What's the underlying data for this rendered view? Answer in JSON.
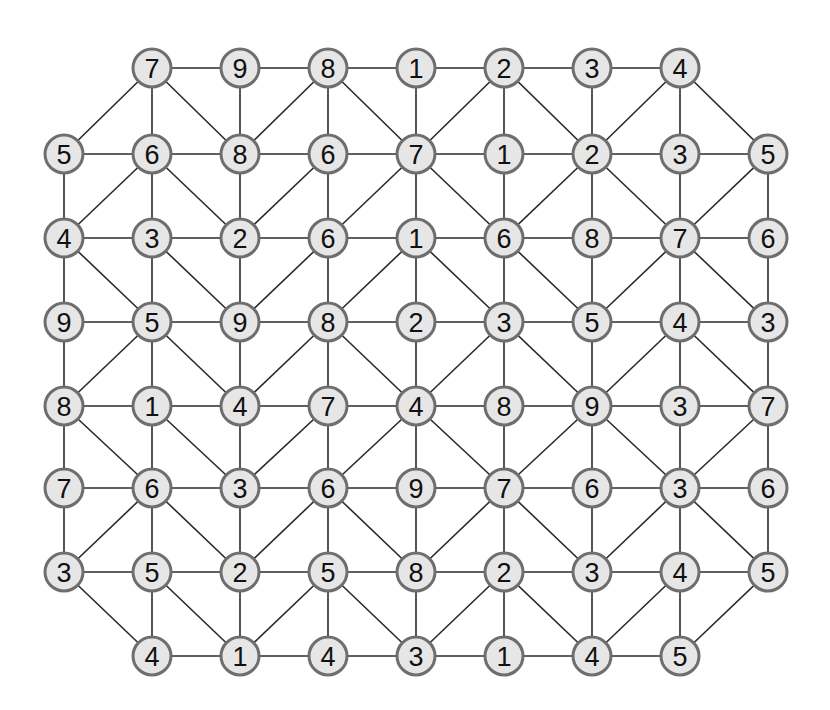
{
  "diagram": {
    "type": "number-graph-puzzle",
    "grid": {
      "col_x": [
        64,
        152,
        240,
        328,
        416,
        504,
        592,
        680,
        768
      ],
      "row_y": [
        68,
        154,
        238,
        322,
        406,
        488,
        572,
        656
      ],
      "node_radius": 19
    },
    "rows": [
      [
        null,
        7,
        9,
        8,
        1,
        2,
        3,
        4,
        null
      ],
      [
        5,
        6,
        8,
        6,
        7,
        1,
        2,
        3,
        5
      ],
      [
        4,
        3,
        2,
        6,
        1,
        6,
        8,
        7,
        6
      ],
      [
        9,
        5,
        9,
        8,
        2,
        3,
        5,
        4,
        3
      ],
      [
        8,
        1,
        4,
        7,
        4,
        8,
        9,
        3,
        7
      ],
      [
        7,
        6,
        3,
        6,
        9,
        7,
        6,
        3,
        6
      ],
      [
        3,
        5,
        2,
        5,
        8,
        2,
        3,
        4,
        5
      ],
      [
        null,
        4,
        1,
        4,
        3,
        1,
        4,
        5,
        null
      ]
    ],
    "diagonal_edges": [
      [
        [
          0,
          1
        ],
        [
          1,
          0
        ]
      ],
      [
        [
          0,
          1
        ],
        [
          1,
          2
        ]
      ],
      [
        [
          0,
          3
        ],
        [
          1,
          2
        ]
      ],
      [
        [
          0,
          3
        ],
        [
          1,
          4
        ]
      ],
      [
        [
          0,
          5
        ],
        [
          1,
          4
        ]
      ],
      [
        [
          0,
          5
        ],
        [
          1,
          6
        ]
      ],
      [
        [
          0,
          7
        ],
        [
          1,
          6
        ]
      ],
      [
        [
          0,
          7
        ],
        [
          1,
          8
        ]
      ],
      [
        [
          1,
          1
        ],
        [
          2,
          0
        ]
      ],
      [
        [
          1,
          1
        ],
        [
          2,
          2
        ]
      ],
      [
        [
          1,
          3
        ],
        [
          2,
          2
        ]
      ],
      [
        [
          1,
          4
        ],
        [
          2,
          3
        ]
      ],
      [
        [
          1,
          4
        ],
        [
          2,
          5
        ]
      ],
      [
        [
          1,
          6
        ],
        [
          2,
          5
        ]
      ],
      [
        [
          1,
          6
        ],
        [
          2,
          7
        ]
      ],
      [
        [
          1,
          8
        ],
        [
          2,
          7
        ]
      ],
      [
        [
          2,
          0
        ],
        [
          3,
          1
        ]
      ],
      [
        [
          2,
          1
        ],
        [
          3,
          2
        ]
      ],
      [
        [
          2,
          3
        ],
        [
          3,
          2
        ]
      ],
      [
        [
          2,
          4
        ],
        [
          3,
          3
        ]
      ],
      [
        [
          2,
          4
        ],
        [
          3,
          5
        ]
      ],
      [
        [
          2,
          5
        ],
        [
          3,
          6
        ]
      ],
      [
        [
          2,
          7
        ],
        [
          3,
          6
        ]
      ],
      [
        [
          2,
          7
        ],
        [
          3,
          8
        ]
      ],
      [
        [
          3,
          1
        ],
        [
          4,
          0
        ]
      ],
      [
        [
          3,
          1
        ],
        [
          4,
          2
        ]
      ],
      [
        [
          3,
          3
        ],
        [
          4,
          2
        ]
      ],
      [
        [
          3,
          3
        ],
        [
          4,
          4
        ]
      ],
      [
        [
          3,
          5
        ],
        [
          4,
          4
        ]
      ],
      [
        [
          3,
          5
        ],
        [
          4,
          6
        ]
      ],
      [
        [
          3,
          7
        ],
        [
          4,
          6
        ]
      ],
      [
        [
          3,
          7
        ],
        [
          4,
          8
        ]
      ],
      [
        [
          4,
          0
        ],
        [
          5,
          1
        ]
      ],
      [
        [
          4,
          1
        ],
        [
          5,
          2
        ]
      ],
      [
        [
          4,
          3
        ],
        [
          5,
          2
        ]
      ],
      [
        [
          4,
          4
        ],
        [
          5,
          3
        ]
      ],
      [
        [
          4,
          4
        ],
        [
          5,
          5
        ]
      ],
      [
        [
          4,
          6
        ],
        [
          5,
          5
        ]
      ],
      [
        [
          4,
          6
        ],
        [
          5,
          7
        ]
      ],
      [
        [
          4,
          8
        ],
        [
          5,
          7
        ]
      ],
      [
        [
          5,
          1
        ],
        [
          6,
          0
        ]
      ],
      [
        [
          5,
          1
        ],
        [
          6,
          2
        ]
      ],
      [
        [
          5,
          3
        ],
        [
          6,
          2
        ]
      ],
      [
        [
          5,
          3
        ],
        [
          6,
          4
        ]
      ],
      [
        [
          5,
          5
        ],
        [
          6,
          4
        ]
      ],
      [
        [
          5,
          5
        ],
        [
          6,
          6
        ]
      ],
      [
        [
          5,
          7
        ],
        [
          6,
          6
        ]
      ],
      [
        [
          5,
          7
        ],
        [
          6,
          8
        ]
      ],
      [
        [
          6,
          0
        ],
        [
          7,
          1
        ]
      ],
      [
        [
          6,
          1
        ],
        [
          7,
          2
        ]
      ],
      [
        [
          6,
          3
        ],
        [
          7,
          2
        ]
      ],
      [
        [
          6,
          3
        ],
        [
          7,
          4
        ]
      ],
      [
        [
          6,
          5
        ],
        [
          7,
          4
        ]
      ],
      [
        [
          6,
          5
        ],
        [
          7,
          6
        ]
      ],
      [
        [
          6,
          7
        ],
        [
          7,
          6
        ]
      ],
      [
        [
          6,
          8
        ],
        [
          7,
          7
        ]
      ]
    ],
    "colors": {
      "node_fill": "#e6e6e6",
      "node_stroke": "#6e6e6e",
      "edge": "#2a2a2a",
      "text": "#111111",
      "background": "#ffffff"
    }
  }
}
